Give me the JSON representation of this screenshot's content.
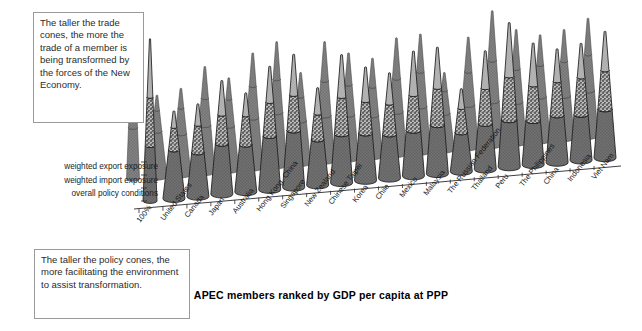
{
  "callouts": {
    "trade": "The taller the trade cones, the more the trade of a member is being transformed by the forces of the New Economy.",
    "policy": "The taller the policy cones, the more facilitating the environment to assist transformation."
  },
  "legend": {
    "items": [
      "weighted export exposure",
      "weighted import exposure",
      "overall policy conditions"
    ]
  },
  "chart_data": {
    "type": "bar",
    "title": "APEC members ranked by GDP per capita at PPP",
    "subtitle": "",
    "xlabel": "APEC members ranked by GDP per capita at PPP",
    "ylabel": "",
    "grid": false,
    "legend_position": "left",
    "stacked": true,
    "style": "3d-stacked-cone",
    "ylim": [
      0,
      100
    ],
    "categories": [
      "100%",
      "United States",
      "Canada",
      "Japan",
      "Australia",
      "Hong Kong, China",
      "Singapore",
      "New Zealand",
      "Chinese Taipei",
      "Korea",
      "Chile",
      "Mexico",
      "Malaysia",
      "The Russian Federation",
      "Thailand",
      "Peru",
      "The Philippines",
      "China",
      "Indonesia",
      "Viet Nam"
    ],
    "series": [
      {
        "name": "overall policy conditions",
        "color": "#6e6e6e",
        "values": [
          34,
          30,
          27,
          31,
          29,
          33,
          35,
          28,
          30,
          29,
          27,
          28,
          30,
          24,
          28,
          29,
          27,
          29,
          28,
          30
        ]
      },
      {
        "name": "weighted import exposure",
        "color": "#d8d8d8",
        "values": [
          30,
          14,
          17,
          18,
          18,
          21,
          22,
          16,
          23,
          20,
          19,
          22,
          23,
          15,
          22,
          27,
          22,
          21,
          23,
          24
        ]
      },
      {
        "name": "weighted export exposure",
        "color": "#b3b3b3",
        "values": [
          36,
          10,
          13,
          21,
          14,
          22,
          25,
          16,
          26,
          21,
          19,
          27,
          25,
          12,
          23,
          33,
          26,
          20,
          21,
          24
        ]
      }
    ]
  }
}
